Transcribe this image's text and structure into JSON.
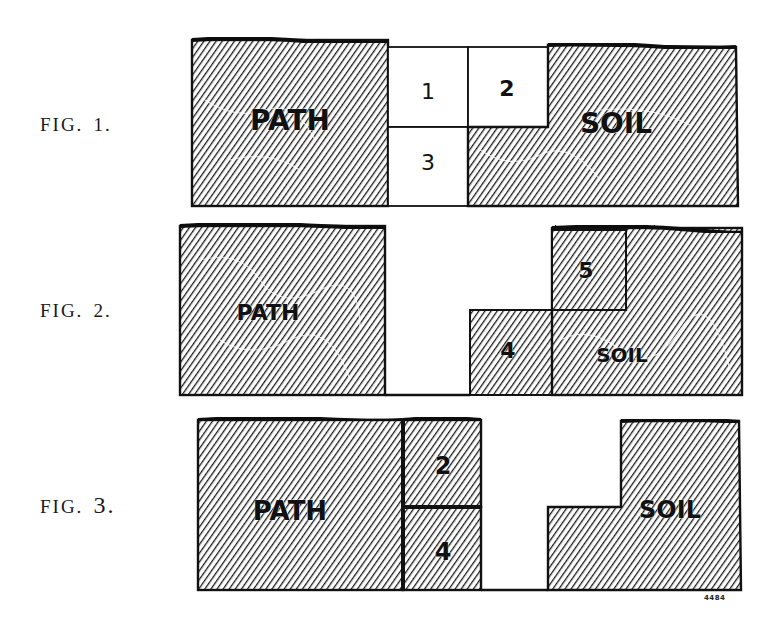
{
  "figures": [
    {
      "label": "FIG.",
      "number": "1.",
      "regions": {
        "path": "PATH",
        "soil": "SOIL"
      },
      "boxes": [
        {
          "id": "1",
          "label": "1",
          "fill": "white"
        },
        {
          "id": "2",
          "label": "2",
          "fill": "white"
        },
        {
          "id": "3",
          "label": "3",
          "fill": "white"
        }
      ]
    },
    {
      "label": "FIG.",
      "number": "2.",
      "regions": {
        "path": "PATH",
        "soil": "SOIL"
      },
      "boxes": [
        {
          "id": "4",
          "label": "4",
          "fill": "hatched"
        },
        {
          "id": "5",
          "label": "5",
          "fill": "hatched"
        }
      ]
    },
    {
      "label": "FIG.",
      "number": "3.",
      "regions": {
        "path": "PATH",
        "soil": "SOIL"
      },
      "boxes": [
        {
          "id": "2",
          "label": "2",
          "fill": "hatched"
        },
        {
          "id": "4",
          "label": "4",
          "fill": "hatched"
        }
      ]
    }
  ],
  "plate_mark": "4484",
  "colors": {
    "ink": "#111111",
    "paper": "#ffffff"
  }
}
